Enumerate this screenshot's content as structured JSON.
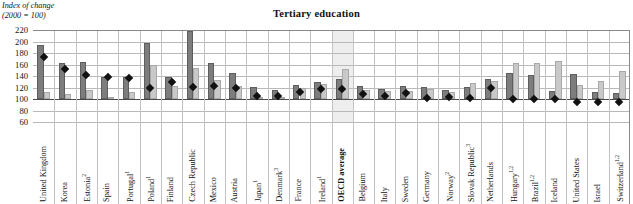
{
  "header": {
    "axis_caption_line1": "Index of change",
    "axis_caption_line2": "(2000 = 100)",
    "title": "Tertiary education"
  },
  "chart_data": {
    "type": "bar",
    "title": "Tertiary education",
    "xlabel": "",
    "ylabel": "Index of change (2000 = 100)",
    "ylim": [
      60,
      220
    ],
    "yticks": [
      60,
      80,
      100,
      120,
      140,
      160,
      180,
      200,
      220
    ],
    "grid": true,
    "legend_position": "none",
    "highlight_category": "OECD average",
    "categories": [
      "United Kingdom",
      "Korea",
      "Estonia²",
      "Spain",
      "Portugal¹",
      "Poland¹",
      "Finland",
      "Czech Republic",
      "Mexico",
      "Austria",
      "Japan¹",
      "Denmark³",
      "France",
      "Ireland¹",
      "OECD average",
      "Belgium",
      "Italy",
      "Sweden",
      "Germany",
      "Norway²",
      "Slovak Republic³",
      "Netherlands",
      "Hungary¹·²",
      "Brazil¹·²",
      "Iceland",
      "United States",
      "Israel",
      "Switzerland¹·²"
    ],
    "categories_plain": [
      "United Kingdom",
      "Korea",
      "Estonia",
      "Spain",
      "Portugal",
      "Poland",
      "Finland",
      "Czech Republic",
      "Mexico",
      "Austria",
      "Japan",
      "Denmark",
      "France",
      "Ireland",
      "OECD average",
      "Belgium",
      "Italy",
      "Sweden",
      "Germany",
      "Norway",
      "Slovak Republic",
      "Netherlands",
      "Hungary",
      "Brazil",
      "Iceland",
      "United States",
      "Israel",
      "Switzerland"
    ],
    "category_footnotes": [
      "",
      "",
      "2",
      "",
      "1",
      "1",
      "",
      "",
      "",
      "",
      "1",
      "3",
      "",
      "1",
      "",
      "",
      "",
      "",
      "",
      "2",
      "3",
      "",
      "1,2",
      "1,2",
      "",
      "",
      "",
      "1,2"
    ],
    "series": [
      {
        "name": "dark-bar",
        "color": "#7d7d7d",
        "values": [
          194,
          163,
          164,
          139,
          138,
          198,
          139,
          218,
          163,
          146,
          121,
          116,
          124,
          129,
          134,
          123,
          118,
          123,
          121,
          115,
          121,
          134,
          146,
          142,
          114,
          143,
          113,
          110
        ]
      },
      {
        "name": "light-bar",
        "color": "#c9c9c9",
        "values": [
          112,
          108,
          116,
          101,
          112,
          160,
          122,
          154,
          133,
          122,
          104,
          100,
          119,
          126,
          152,
          116,
          114,
          114,
          118,
          113,
          127,
          131,
          162,
          162,
          166,
          125,
          131,
          148
        ]
      }
    ],
    "markers": {
      "name": "diamond-marker",
      "color": "#111111",
      "values": [
        173,
        152,
        141,
        139,
        137,
        120,
        129,
        121,
        122,
        120,
        105,
        106,
        112,
        117,
        117,
        109,
        105,
        110,
        102,
        104,
        101,
        119,
        100,
        100,
        100,
        95,
        95,
        95
      ]
    }
  }
}
